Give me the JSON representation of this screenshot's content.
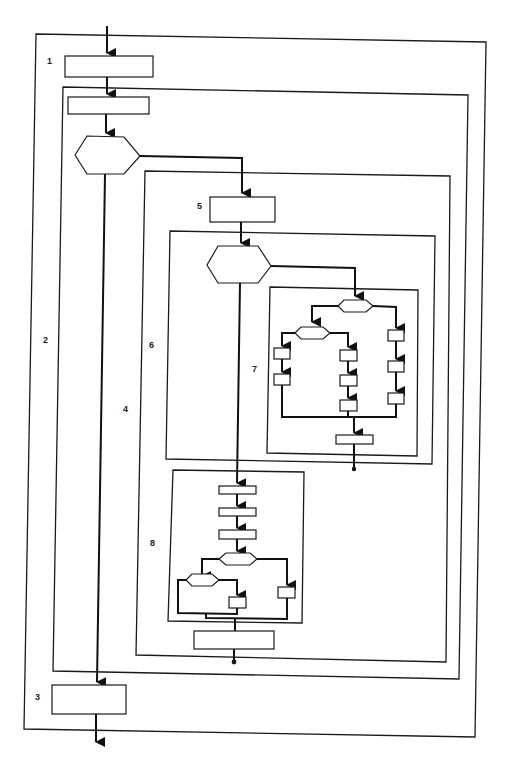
{
  "diagram": {
    "type": "nested structured flowchart",
    "region_labels": [
      {
        "id": "1",
        "text": "1",
        "x": 47,
        "y": 60
      },
      {
        "id": "2",
        "text": "2",
        "x": 43,
        "y": 336
      },
      {
        "id": "3",
        "text": "3",
        "x": 35,
        "y": 692
      },
      {
        "id": "4",
        "text": "4",
        "x": 123,
        "y": 404
      },
      {
        "id": "5",
        "text": "5",
        "x": 197,
        "y": 204
      },
      {
        "id": "6",
        "text": "6",
        "x": 149,
        "y": 341
      },
      {
        "id": "7",
        "text": "7",
        "x": 252,
        "y": 364
      },
      {
        "id": "8",
        "text": "8",
        "x": 150,
        "y": 540
      }
    ],
    "colors": {
      "line": "#111111",
      "background": "#ffffff"
    }
  }
}
